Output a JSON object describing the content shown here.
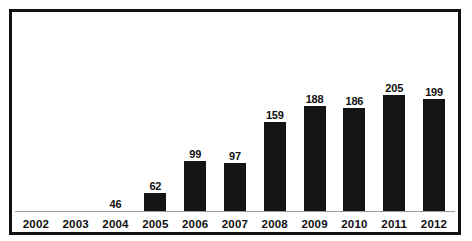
{
  "chart_data": {
    "type": "bar",
    "title": "",
    "subtitle": "",
    "xlabel": "",
    "ylabel": "",
    "grid": false,
    "legend": false,
    "axis": {
      "x_axis_line": true,
      "y_axis_visible": false,
      "ylim": [
        0,
        205
      ]
    },
    "categories": [
      "2002",
      "2003",
      "2004",
      "2005",
      "2006",
      "2007",
      "2008",
      "2009",
      "2010",
      "2011",
      "2012"
    ],
    "values": [
      null,
      null,
      46,
      62,
      99,
      97,
      159,
      188,
      186,
      205,
      199
    ],
    "data_labels": [
      "",
      "",
      "46",
      "62",
      "99",
      "97",
      "159",
      "188",
      "186",
      "205",
      "199"
    ],
    "bar_visible": [
      false,
      false,
      false,
      true,
      true,
      true,
      true,
      true,
      true,
      true,
      true
    ],
    "bar_pixel_heights": [
      0,
      0,
      0,
      18,
      50,
      48,
      89,
      105,
      103,
      116,
      112
    ],
    "colors": {
      "bar": "#141414",
      "label": "#111111",
      "axis_line": "#9a9a9a",
      "frame": "#111111",
      "background": "#ffffff"
    }
  }
}
